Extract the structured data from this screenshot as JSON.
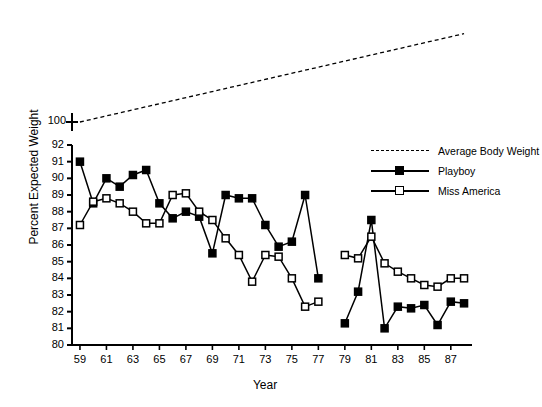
{
  "chart_data": {
    "type": "line",
    "title": "",
    "xlabel": "Year",
    "ylabel": "Percent Expected Weight",
    "xlim": [
      58.4,
      88.6
    ],
    "ylim": [
      80,
      92
    ],
    "y_break_value": 100,
    "grid": false,
    "legend_position": "upper right",
    "xticks": [
      59,
      61,
      63,
      65,
      67,
      69,
      71,
      73,
      75,
      77,
      79,
      81,
      83,
      85,
      87
    ],
    "xticklabels": [
      "59",
      "61",
      "63",
      "65",
      "67",
      "69",
      "71",
      "73",
      "75",
      "77",
      "79",
      "81",
      "83",
      "85",
      "87"
    ],
    "yticks": [
      80,
      81,
      82,
      83,
      84,
      85,
      86,
      87,
      88,
      89,
      90,
      91,
      92,
      100
    ],
    "yticklabels": [
      "80",
      "81",
      "82",
      "83",
      "84",
      "85",
      "86",
      "87",
      "88",
      "89",
      "90",
      "91",
      "92",
      "100"
    ],
    "series": [
      {
        "name": "Average Body Weight",
        "style": "dashed",
        "marker": "none",
        "color": "#000000",
        "x": [
          59,
          88
        ],
        "values": [
          100.0,
          105.3
        ]
      },
      {
        "name": "Playboy",
        "style": "solid",
        "marker": "filled-square",
        "color": "#000000",
        "x": [
          59,
          60,
          61,
          62,
          63,
          64,
          65,
          66,
          67,
          68,
          69,
          70,
          71,
          72,
          73,
          74,
          75,
          76,
          77,
          79,
          80,
          81,
          82,
          83,
          84,
          85,
          86,
          87,
          88
        ],
        "values": [
          91.0,
          88.5,
          90.0,
          89.5,
          90.2,
          90.5,
          88.5,
          87.6,
          88.0,
          87.7,
          85.5,
          89.0,
          88.8,
          88.8,
          87.2,
          85.9,
          86.2,
          89.0,
          84.0,
          81.3,
          83.2,
          87.5,
          81.0,
          82.3,
          82.2,
          82.4,
          81.2,
          82.6,
          82.5
        ]
      },
      {
        "name": "Miss America",
        "style": "solid",
        "marker": "open-square",
        "color": "#000000",
        "x": [
          59,
          60,
          61,
          62,
          63,
          64,
          65,
          66,
          67,
          68,
          69,
          70,
          71,
          72,
          73,
          74,
          75,
          76,
          77,
          79,
          80,
          81,
          82,
          83,
          84,
          85,
          86,
          87,
          88
        ],
        "values": [
          87.2,
          88.6,
          88.8,
          88.5,
          88.0,
          87.3,
          87.3,
          89.0,
          89.1,
          88.0,
          87.5,
          86.4,
          85.4,
          83.8,
          85.4,
          85.3,
          84.0,
          82.3,
          82.6,
          85.4,
          85.2,
          86.5,
          84.9,
          84.4,
          84.0,
          83.6,
          83.5,
          84.0,
          84.0
        ]
      }
    ]
  },
  "legend": {
    "items": [
      {
        "label": "Average Body Weight",
        "key": "dashed-line-key"
      },
      {
        "label": "Playboy",
        "key": "filled-square-key"
      },
      {
        "label": "Miss America",
        "key": "open-square-key"
      }
    ]
  }
}
